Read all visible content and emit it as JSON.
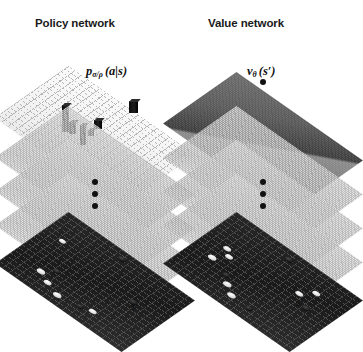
{
  "figure": {
    "background_color": "#ffffff",
    "caption_absent": true
  },
  "networks": [
    {
      "id": "policy",
      "title": "Policy network",
      "output_label_parts": {
        "main": "p",
        "subscript": "σ/ρ",
        "args": "(a|s)"
      },
      "output_label_text": "pσ/ρ (a|s)",
      "input_label": "s",
      "top_layer_style": "light-grid-with-bars",
      "top_layer_color": "#f2f2f2",
      "bottom_layer_color": "#1f1f1f",
      "mid_layer_color": "#b4b4b4",
      "mid_layer_count": 3,
      "ellipsis_dot_count": 3,
      "has_top_dot": false
    },
    {
      "id": "value",
      "title": "Value network",
      "output_label_parts": {
        "main": "v",
        "subscript": "θ",
        "args": "(s′)"
      },
      "output_label_text": "vθ (s′)",
      "input_label": "s′",
      "top_layer_style": "dark-shaded-diamond",
      "top_layer_color": "#5a5a5a",
      "bottom_layer_color": "#1f1f1f",
      "mid_layer_color": "#b4b4b4",
      "mid_layer_count": 3,
      "ellipsis_dot_count": 3,
      "has_top_dot": true
    }
  ],
  "colors": {
    "text": "#111111",
    "dot": "#111111",
    "bar": "#0d0d0d",
    "white_stone": "#ffffff",
    "black_stone": "#000000"
  }
}
